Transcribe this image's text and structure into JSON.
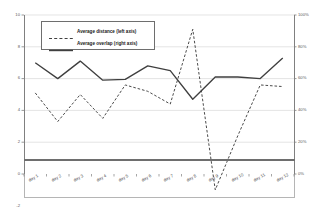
{
  "chart_data": {
    "type": "line",
    "title": "",
    "xlabel": "",
    "ylabel": "",
    "categories": [
      "day 1",
      "day 2",
      "day 3",
      "day 4",
      "day 5",
      "day 6",
      "day 7",
      "day 8",
      "day 9",
      "day 10",
      "day 11",
      "day 12"
    ],
    "grid": true,
    "legend_position": "top-left-inside",
    "axes": {
      "left": {
        "label": "",
        "ylim": [
          -2,
          10
        ],
        "ticks": [
          10,
          8,
          6,
          4,
          2,
          0,
          -2
        ],
        "tick_labels": [
          "10",
          "8",
          "6",
          "4",
          "2",
          "0",
          "-2"
        ]
      },
      "right": {
        "label": "",
        "ylim": [
          -20,
          100
        ],
        "ticks": [
          100,
          80,
          60,
          40,
          20,
          0
        ],
        "tick_labels": [
          "100%",
          "80%",
          "60%",
          "40%",
          "20%",
          "0%"
        ]
      }
    },
    "series": [
      {
        "name": "Average distance (left axis)",
        "axis": "left",
        "style": "dashed",
        "color": "#404040",
        "values": [
          5.1,
          3.3,
          5.0,
          3.5,
          5.6,
          5.2,
          4.4,
          9.1,
          -1.0,
          2.4,
          5.6,
          5.5
        ]
      },
      {
        "name": "Average overlap (right axis)",
        "axis": "right",
        "style": "solid",
        "color": "#3f3f3f",
        "values": [
          70,
          60,
          71,
          59,
          59.5,
          68,
          65,
          47,
          61,
          61,
          60,
          73
        ]
      }
    ]
  },
  "legend": {
    "entries": [
      {
        "label": "Average distance (left axis)",
        "style": "dashed"
      },
      {
        "label": "Average overlap (right axis)",
        "style": "solid"
      }
    ]
  },
  "colors": {
    "grid": "#d9d9d9",
    "axis": "#808080",
    "baseline": "#6e6e6e",
    "series_dashed": "#404040",
    "series_solid": "#3f3f3f",
    "text": "#4a4a4a",
    "background": "#ffffff"
  }
}
